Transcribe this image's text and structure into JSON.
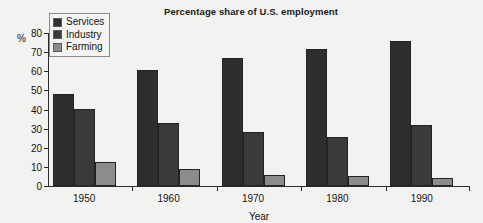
{
  "chart_data": {
    "type": "bar",
    "title": "Percentage share of U.S. employment",
    "xlabel": "Year",
    "ylabel": "%",
    "categories": [
      "1950",
      "1960",
      "1970",
      "1980",
      "1990"
    ],
    "series": [
      {
        "name": "Services",
        "color": "#2e2e2e",
        "values": [
          48,
          60.5,
          67,
          71.5,
          76
        ]
      },
      {
        "name": "Industry",
        "color": "#3a3a3a",
        "values": [
          40.5,
          33,
          28,
          25.5,
          32
        ]
      },
      {
        "name": "Farming",
        "color": "#8c8c8c",
        "values": [
          12.5,
          9,
          5.5,
          5,
          4
        ]
      }
    ],
    "ylim": [
      0,
      80
    ],
    "yticks": [
      0,
      10,
      20,
      30,
      40,
      50,
      60,
      70,
      80
    ],
    "ytick_labels": [
      "0",
      "10",
      "20",
      "30",
      "40",
      "50",
      "60",
      "70",
      "80"
    ],
    "grid": false,
    "legend_position": "top-left",
    "background": "#f2f2f0"
  },
  "legend": {
    "entries": [
      {
        "label": "Services",
        "color": "#2e2e2e"
      },
      {
        "label": "Industry",
        "color": "#3a3a3a"
      },
      {
        "label": "Farming",
        "color": "#8c8c8c"
      }
    ]
  }
}
